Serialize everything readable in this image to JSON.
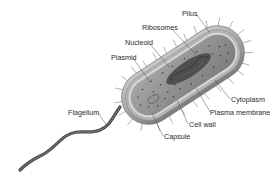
{
  "diagram": {
    "labels": {
      "pilus": "Pilus",
      "ribosomes": "Ribosomes",
      "nucleoid": "Nucleoid",
      "plasmid": "Plasmid",
      "cytoplasm": "Cytoplasm",
      "plasma_membrane": "Plasma membrane",
      "cell_wall": "Cell wall",
      "capsule": "Capsule",
      "flagellum": "Flagellum"
    },
    "colors": {
      "background": "#ffffff",
      "capsule": "#9a9a9a",
      "cell_wall": "#bdbdbd",
      "plasma_membrane": "#d6d6d6",
      "cytoplasm": "#8e8e8e",
      "nucleoid": "#4a4a4a",
      "flagellum": "#555555",
      "leader_line": "#555555",
      "text": "#2a2a2a"
    }
  }
}
